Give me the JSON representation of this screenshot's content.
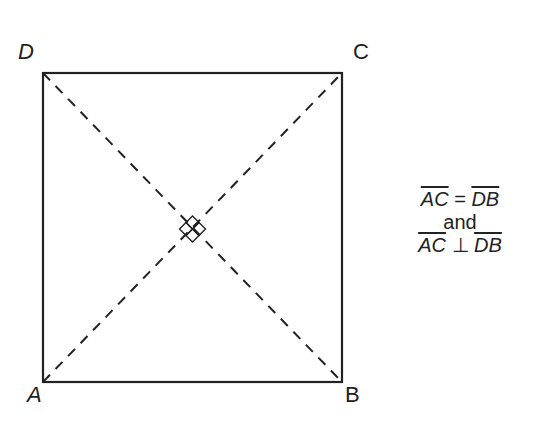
{
  "diagram": {
    "type": "square with diagonals",
    "vertices": {
      "A": {
        "label": "A",
        "x": 43,
        "y": 382
      },
      "B": {
        "label": "B",
        "x": 342,
        "y": 382
      },
      "C": {
        "label": "C",
        "x": 342,
        "y": 73
      },
      "D": {
        "label": "D",
        "x": 43,
        "y": 73
      }
    },
    "diagonals": [
      "AC",
      "DB"
    ],
    "right_angle_marker": "at intersection of diagonals",
    "stroke_color": "#222222"
  },
  "conditions": {
    "line1": {
      "left": "AC",
      "op": "=",
      "right": "DB"
    },
    "line2": "and",
    "line3": {
      "left": "AC",
      "op": "⊥",
      "right": "DB"
    }
  }
}
